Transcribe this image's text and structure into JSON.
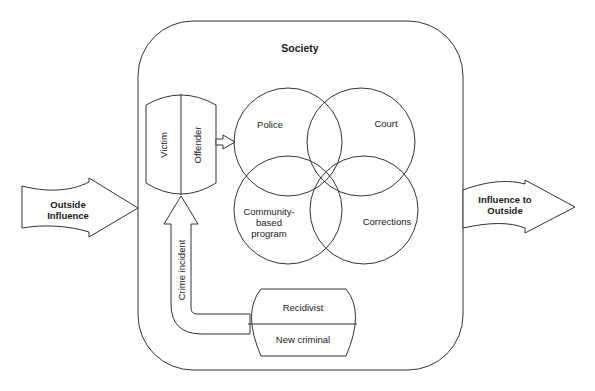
{
  "diagram": {
    "society": {
      "label": "Society"
    },
    "outside_influence": {
      "line1": "Outside",
      "line2": "Influence"
    },
    "influence_to_outside": {
      "line1": "Influence to",
      "line2": "Outside"
    },
    "participants": {
      "victim": "Victim",
      "offender": "Offender"
    },
    "agencies": {
      "police": "Police",
      "court": "Court",
      "community_line1": "Community-",
      "community_line2": "based",
      "community_line3": "program",
      "corrections": "Corrections"
    },
    "crime_incident": {
      "label": "Crime incident"
    },
    "outcomes": {
      "recidivist": "Recidivist",
      "new_criminal": "New criminal"
    }
  },
  "colors": {
    "stroke": "#333333",
    "background": "#ffffff",
    "text": "#1a1a1a"
  }
}
